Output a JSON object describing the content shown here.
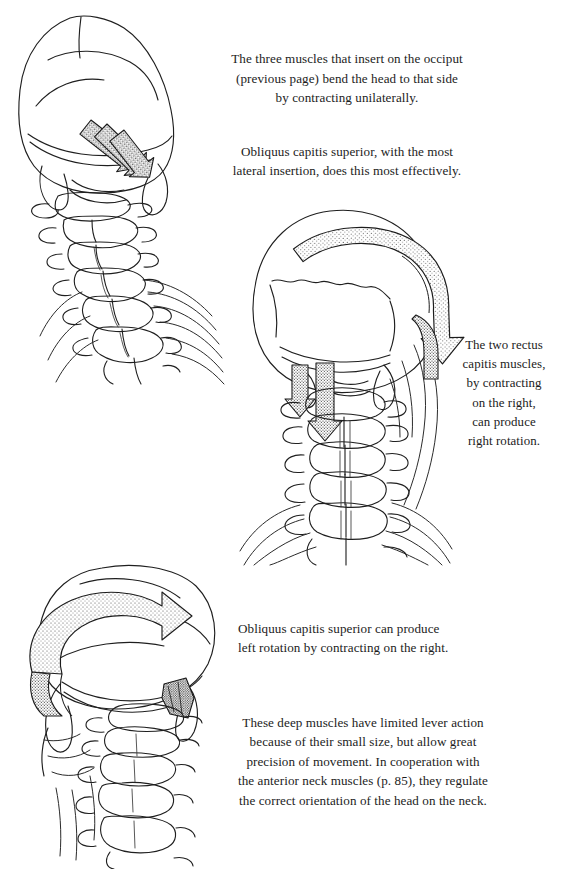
{
  "page": {
    "background": "#ffffff",
    "ink": "#1a1a1a",
    "width": 571,
    "height": 869
  },
  "text_blocks": {
    "intro": {
      "paragraph_1": "The three muscles that insert on the occiput\n(previous page) bend the head to that side\nby contracting unilaterally.",
      "paragraph_2": "Obliquus capitis superior, with the most\nlateral insertion, does this most effectively."
    },
    "rectus_caption": "The two rectus\ncapitis muscles,\nby contracting\non the right,\ncan produce\nright rotation.",
    "obliquus_caption": "Obliquus capitis superior can produce\nleft rotation by contracting on the right.",
    "summary": "These deep muscles have limited lever action\nbecause of their small size, but allow great\nprecision of movement. In cooperation with\nthe anterior neck muscles (p. 85), they regulate\nthe correct orientation of the head on the neck."
  },
  "figures": {
    "top_left": {
      "name": "posterior-oblique-skull-cervical-spine",
      "description": "Posterior oblique view of skull with cervical spine tilted to the left and upper ribs fanning to the right",
      "arrows": "three parallel stippled straight arrows directed inferolaterally from the occiput"
    },
    "middle": {
      "name": "posterior-skull-cervical-spine-rotation",
      "description": "Posterior view of skull and full cervical spine with upper thoracic ribs",
      "arrows": "one large curved stippled ribbon arrow sweeping right-to-left over the cranium, and two short straight stippled arrows pointing inferiorly at the upper cervical segment"
    },
    "bottom_left": {
      "name": "posterior-skull-left-rotation",
      "description": "Posterior oblique view of skull tipped forward with cervical spine descending",
      "arrows": "one large curved stippled ribbon arrow sweeping left-to-right across the occiput"
    }
  }
}
